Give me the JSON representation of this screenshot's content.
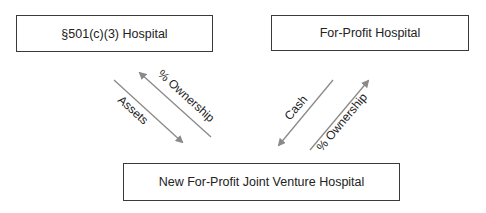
{
  "diagram": {
    "nodes": [
      {
        "id": "nonprofit",
        "label": "§501(c)(3) Hospital"
      },
      {
        "id": "forprofit",
        "label": "For-Profit Hospital"
      },
      {
        "id": "jv",
        "label": "New For-Profit Joint Venture Hospital"
      }
    ],
    "edges": [
      {
        "from": "nonprofit",
        "to": "jv",
        "label": "Assets"
      },
      {
        "from": "jv",
        "to": "nonprofit",
        "label": "% Ownership"
      },
      {
        "from": "forprofit",
        "to": "jv",
        "label": "Cash"
      },
      {
        "from": "jv",
        "to": "forprofit",
        "label": "% Ownership"
      }
    ],
    "colors": {
      "arrow": "#8a8a8a",
      "border": "#3a3a3a",
      "text": "#222222"
    }
  }
}
